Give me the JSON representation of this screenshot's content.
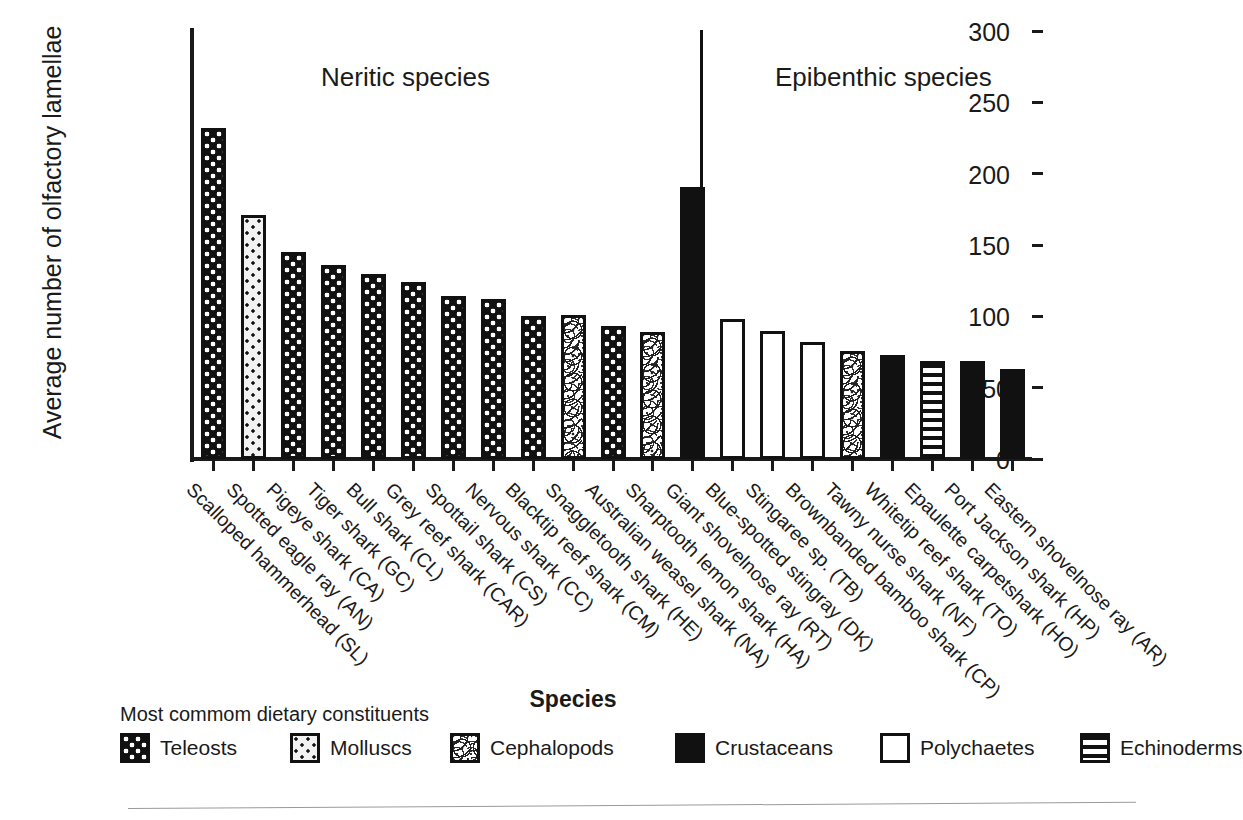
{
  "chart_data": {
    "type": "bar",
    "title": "",
    "xlabel": "Species",
    "ylabel": "Average number of olfactory lamellae",
    "ylim": [
      0,
      300
    ],
    "yticks": [
      0,
      50,
      100,
      150,
      200,
      250,
      300
    ],
    "ytick_labels": [
      "0",
      "50",
      "100",
      "150",
      "200",
      "250",
      "300"
    ],
    "grid": false,
    "legend_position": "bottom",
    "group_labels": [
      "Neritic species",
      "Epibenthic species"
    ],
    "group_divider_after_category": 13,
    "categories": [
      "Scalloped hammerhead (SL)",
      "Spotted eagle ray (AN)",
      "Pigeye shark (CA)",
      "Tiger shark (GC)",
      "Bull shark (CL)",
      "Grey reef shark (CAR)",
      "Spottail shark (CS)",
      "Nervous shark (CC)",
      "Blacktip reef shark (CM)",
      "Snaggletooth shark (HE)",
      "Australian weasel shark (NA)",
      "Sharptooth lemon shark (HA)",
      "Giant shovelnose ray (RT)",
      "Blue-spotted stingray (DK)",
      "Stingaree sp. (TB)",
      "Brownbanded bamboo shark (CP)",
      "Tawny nurse shark (NF)",
      "Whitetip reef shark (TO)",
      "Epaulette carpetshark (HO)",
      "Port Jackson shark (HP)",
      "Eastern shovelnose ray (AR)"
    ],
    "values": [
      232,
      171,
      145,
      136,
      130,
      124,
      114,
      112,
      100,
      101,
      93,
      89,
      191,
      98,
      90,
      82,
      76,
      73,
      69,
      69,
      63
    ],
    "categories_group": [
      "Neritic",
      "Neritic",
      "Neritic",
      "Neritic",
      "Neritic",
      "Neritic",
      "Neritic",
      "Neritic",
      "Neritic",
      "Neritic",
      "Neritic",
      "Neritic",
      "Epibenthic",
      "Epibenthic",
      "Epibenthic",
      "Epibenthic",
      "Epibenthic",
      "Epibenthic",
      "Epibenthic",
      "Epibenthic",
      "Epibenthic"
    ],
    "diet_by_bar": [
      "teleosts",
      "molluscs",
      "teleosts",
      "teleosts",
      "teleosts",
      "teleosts",
      "teleosts",
      "teleosts",
      "teleosts",
      "cephalopods",
      "teleosts",
      "cephalopods",
      "crustaceans",
      "polychaetes",
      "polychaetes",
      "polychaetes",
      "cephalopods",
      "crustaceans",
      "echinoderms",
      "crustaceans",
      "crustaceans"
    ]
  },
  "legend": {
    "title": "Most commom dietary constituents",
    "items": [
      {
        "key": "teleosts",
        "label": "Teleosts"
      },
      {
        "key": "molluscs",
        "label": "Molluscs"
      },
      {
        "key": "cephalopods",
        "label": "Cephalopods"
      },
      {
        "key": "crustaceans",
        "label": "Crustaceans"
      },
      {
        "key": "polychaetes",
        "label": "Polychaetes"
      },
      {
        "key": "echinoderms",
        "label": "Echinoderms"
      }
    ]
  },
  "colors": {
    "ink": "#1a1a1a",
    "bar_fill_dark": "#111111",
    "bar_fill_light": "#ffffff",
    "background": "#ffffff"
  }
}
